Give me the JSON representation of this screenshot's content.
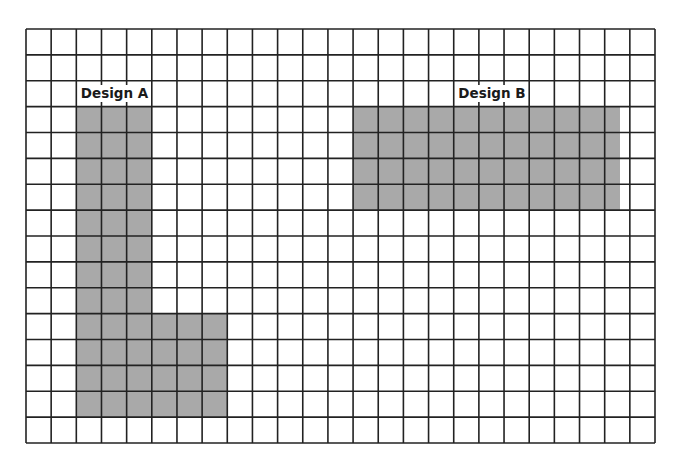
{
  "grid": {
    "columns": 25,
    "rows": 16,
    "line_color": "#222222",
    "fill_color": "#a9a9a9"
  },
  "designs": [
    {
      "id": "design-a",
      "label": "Design A",
      "label_cols": [
        2,
        5
      ],
      "label_row": 2,
      "regions": [
        {
          "col": 2,
          "row": 3,
          "cols": 3,
          "rows": 12
        },
        {
          "col": 5,
          "row": 11,
          "cols": 3,
          "rows": 4
        }
      ]
    },
    {
      "id": "design-b",
      "label": "Design B",
      "label_cols": [
        17,
        20
      ],
      "label_row": 2,
      "regions": [
        {
          "col": 13,
          "row": 3,
          "cols": 10.6,
          "rows": 4
        }
      ]
    }
  ]
}
